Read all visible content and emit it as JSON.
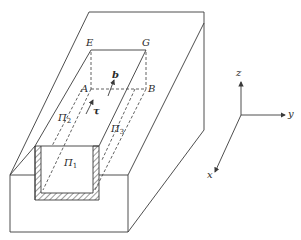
{
  "diagram": {
    "colors": {
      "stroke": "#3a3a3a",
      "background": "#ffffff",
      "text": "#2a2a2a"
    },
    "points": {
      "E": "E",
      "G": "G",
      "A": "A",
      "B": "B"
    },
    "vectors": {
      "b": "b",
      "tau": "τ"
    },
    "surfaces": {
      "pi1": {
        "symbol": "Π",
        "index": "1"
      },
      "pi2": {
        "symbol": "Π",
        "index": "2"
      },
      "pi3": {
        "symbol": "Π",
        "index": "3"
      }
    },
    "axes": {
      "x": "x",
      "y": "y",
      "z": "z"
    }
  }
}
